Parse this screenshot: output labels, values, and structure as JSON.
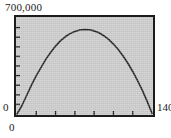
{
  "figure": {
    "name": "parabolic-curve-plot",
    "background_color": "#ffffff",
    "plot_background_color": "#c9c9c9",
    "frame_color": "#1c1c1c",
    "curve_color": "#1c1c1c"
  },
  "labels": {
    "y_max": "700,000",
    "y_min": "0",
    "x_min": "0",
    "x_max": "140"
  },
  "chart_data": {
    "type": "line",
    "title": "",
    "xlabel": "",
    "ylabel": "",
    "xlim": [
      0,
      140
    ],
    "ylim": [
      0,
      700000
    ],
    "x_tick_labels": [
      "0",
      "140"
    ],
    "y_tick_labels": [
      "0",
      "700,000"
    ],
    "x_major_ticks": [
      0,
      20,
      40,
      60,
      80,
      100,
      120,
      140
    ],
    "y_major_ticks": [
      0,
      70000,
      140000,
      210000,
      280000,
      350000,
      420000,
      490000,
      560000,
      630000,
      700000
    ],
    "grid": false,
    "legend": null,
    "series": [
      {
        "name": "curve",
        "x": [
          0,
          5,
          10,
          15,
          20,
          25,
          30,
          35,
          40,
          45,
          50,
          55,
          60,
          65,
          70,
          75,
          80,
          85,
          90,
          95,
          100,
          105,
          110,
          115,
          120,
          125,
          130,
          135,
          140
        ],
        "y": [
          0,
          60000,
          135000,
          210000,
          280000,
          340000,
          400000,
          450000,
          495000,
          533000,
          563000,
          586000,
          602000,
          612000,
          616000,
          614000,
          606000,
          592000,
          571000,
          544000,
          510000,
          470000,
          423000,
          370000,
          310000,
          244000,
          172000,
          92000,
          5000
        ]
      }
    ]
  }
}
